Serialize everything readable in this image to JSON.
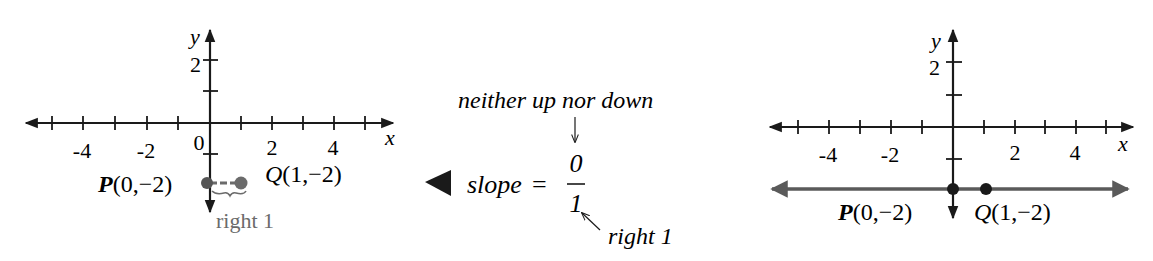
{
  "left_graph": {
    "axis_x_label": "x",
    "axis_y_label": "y",
    "x_ticks": [
      "-4",
      "-2",
      "0",
      "2",
      "4"
    ],
    "y_ticks": [
      "2"
    ],
    "point_p": {
      "name": "P",
      "coords": "(0,−2)"
    },
    "point_q": {
      "name": "Q",
      "coords": "(1,−2)"
    },
    "annotation": "right 1",
    "highlight_color": "#6b6b6b"
  },
  "explanation": {
    "marker_icon": "left-triangle",
    "top_note": "neither up nor down",
    "slope_word": "slope",
    "equals": "=",
    "numerator": "0",
    "denominator": "1",
    "bottom_note": "right 1"
  },
  "right_graph": {
    "axis_x_label": "x",
    "axis_y_label": "y",
    "x_ticks": [
      "-4",
      "-2",
      "2",
      "4"
    ],
    "y_ticks": [
      "2"
    ],
    "point_p": {
      "name": "P",
      "coords": "(0,−2)"
    },
    "point_q": {
      "name": "Q",
      "coords": "(1,−2)"
    },
    "line_color": "#5a5a5a"
  }
}
